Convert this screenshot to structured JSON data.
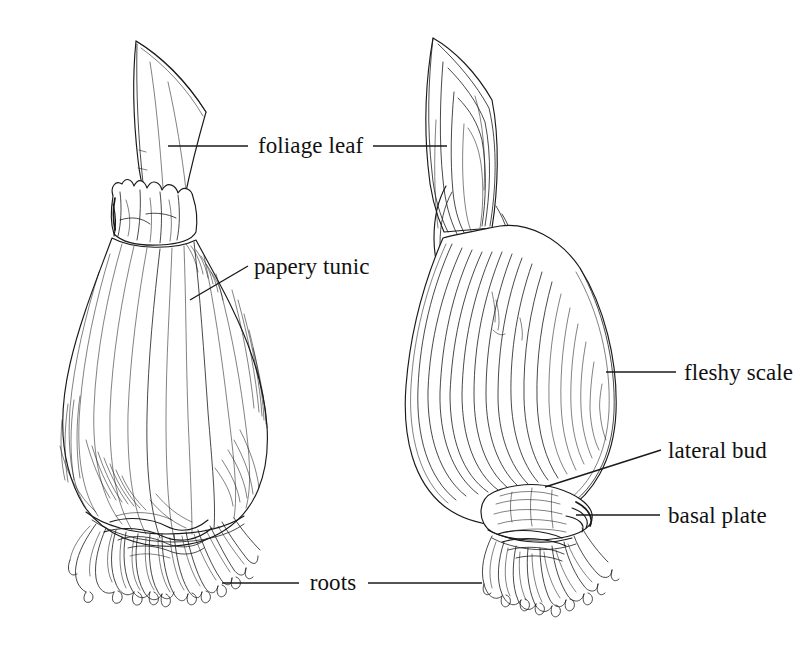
{
  "figure": {
    "background_color": "#ffffff",
    "ink_color": "#1a1a1a"
  },
  "labels": [
    {
      "id": "foliage-leaf",
      "text": "foliage leaf",
      "x": 258,
      "y": 153,
      "anchor": "start",
      "leaders": [
        {
          "type": "line",
          "x1": 168,
          "y1": 146,
          "x2": 248,
          "y2": 146
        },
        {
          "type": "line",
          "x1": 373,
          "y1": 146,
          "x2": 447,
          "y2": 146
        }
      ]
    },
    {
      "id": "papery-tunic",
      "text": "papery tunic",
      "x": 254,
      "y": 274,
      "anchor": "start",
      "leaders": [
        {
          "type": "line",
          "x1": 190,
          "y1": 300,
          "x2": 248,
          "y2": 266
        }
      ]
    },
    {
      "id": "fleshy-scale",
      "text": "fleshy scale",
      "x": 684,
      "y": 380,
      "anchor": "start",
      "leaders": [
        {
          "type": "line",
          "x1": 606,
          "y1": 372,
          "x2": 676,
          "y2": 372
        }
      ]
    },
    {
      "id": "lateral-bud",
      "text": "lateral bud",
      "x": 668,
      "y": 458,
      "anchor": "start",
      "leaders": [
        {
          "type": "line",
          "x1": 545,
          "y1": 487,
          "x2": 661,
          "y2": 450
        }
      ]
    },
    {
      "id": "basal-plate",
      "text": "basal plate",
      "x": 668,
      "y": 523,
      "anchor": "start",
      "leaders": [
        {
          "type": "line",
          "x1": 576,
          "y1": 515,
          "x2": 660,
          "y2": 515
        }
      ]
    },
    {
      "id": "roots",
      "text": "roots",
      "x": 333,
      "y": 590,
      "anchor": "middle",
      "leaders": [
        {
          "type": "line",
          "x1": 222,
          "y1": 583,
          "x2": 299,
          "y2": 583
        },
        {
          "type": "line",
          "x1": 368,
          "y1": 583,
          "x2": 482,
          "y2": 583
        }
      ]
    }
  ],
  "specimens": [
    {
      "id": "whole-bulb",
      "name": "whole bulb with papery tunic",
      "side": "left",
      "parts": [
        "foliage leaf",
        "papery tunic",
        "roots"
      ]
    },
    {
      "id": "sectioned-bulb",
      "name": "longitudinal section of bulb",
      "side": "right",
      "parts": [
        "foliage leaf",
        "fleshy scale",
        "lateral bud",
        "basal plate",
        "roots"
      ]
    }
  ]
}
